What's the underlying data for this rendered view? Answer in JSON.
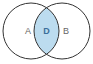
{
  "diagram": {
    "type": "venn",
    "sets": [
      {
        "id": "A",
        "label": "A",
        "cx": 31,
        "cy": 31,
        "r": 28
      },
      {
        "id": "B",
        "label": "B",
        "cx": 62,
        "cy": 31,
        "r": 28
      }
    ],
    "intersection": {
      "label": "D",
      "fill": "#bcdcef"
    },
    "colors": {
      "stroke": "#333333",
      "label": "#666666",
      "intersection_label": "#3a6f9a",
      "background": "#ffffff"
    }
  }
}
